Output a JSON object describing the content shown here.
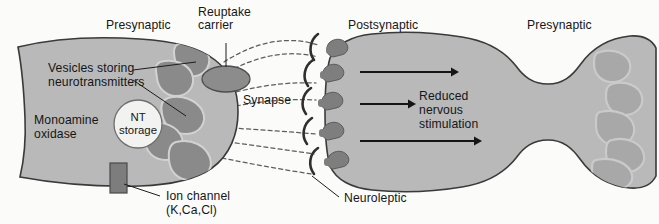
{
  "figure": {
    "background_color": "#fbfbfa",
    "colors": {
      "cell_fill": "#b9b9b9",
      "cell_outline": "#3a3a3a",
      "vesicle_fill": "#8a8a8a",
      "vesicle_outline": "#cfcfcf",
      "receptor_fill": "#7e7e7e",
      "carrier_fill": "#8c8c8c",
      "ion_channel_fill": "#7d7d7d",
      "nt_storage_fill": "#f2f2f0",
      "text_color": "#161616",
      "cleft_dash_color": "#5d5d5d",
      "arrow_color": "#151515",
      "right_vesicle_fill": "#a8a8a8"
    }
  },
  "labels": {
    "presynaptic_left": "Presynaptic",
    "reuptake_carrier": {
      "line1": "Reuptake",
      "line2": "carrier"
    },
    "postsynaptic": "Postsynaptic",
    "presynaptic_right": "Presynaptic",
    "vesicles": {
      "line1": "Vesicles storing",
      "line2": "neurotransmitters"
    },
    "synapse": "Synapse",
    "monoamine_oxidase": {
      "line1": "Monoamine",
      "line2": "oxidase"
    },
    "nt_storage": {
      "line1": "NT",
      "line2": "storage"
    },
    "reduced_stimulation": {
      "line1": "Reduced",
      "line2": "nervous",
      "line3": "stimulation"
    },
    "ion_channel": {
      "line1": "Ion channel",
      "line2": "(K,Ca,Cl)"
    },
    "neuroleptic": "Neuroleptic"
  },
  "structures": {
    "presynaptic_terminal_left": "presynaptic axon terminal with vesicles",
    "postsynaptic_neuron": "postsynaptic cell body and axon",
    "synaptic_cleft": "dashed neurotransmitter diffusion paths",
    "receptor_count": 5,
    "neuroleptic_blocker_count": 5,
    "arrow_count": 3,
    "vesicle_count_left": 5,
    "vesicle_count_right": 5
  }
}
